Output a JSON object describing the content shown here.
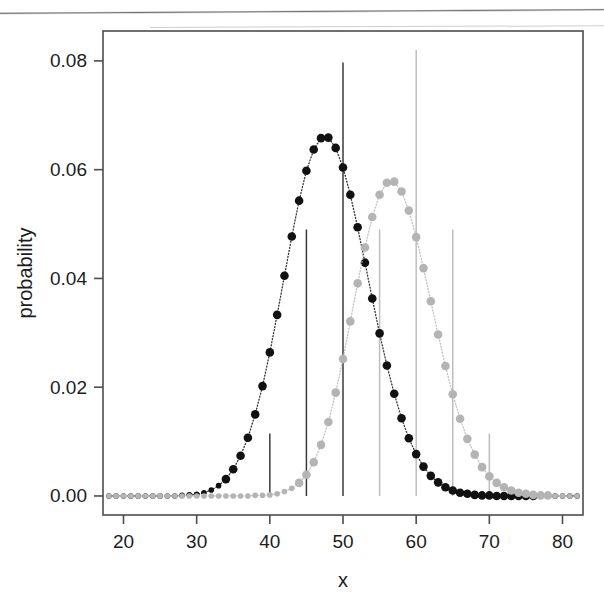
{
  "figure": {
    "kind": "scatter-pmf-plot",
    "background_color": "#ffffff",
    "frame_color": "#4d4d4d",
    "has_top_scan_artifact": true
  },
  "axes": {
    "x_label": "x",
    "y_label": "probability",
    "x_ticks": [
      "20",
      "30",
      "40",
      "50",
      "60",
      "70",
      "80"
    ],
    "y_ticks": [
      "0.00",
      "0.02",
      "0.04",
      "0.06",
      "0.08"
    ]
  },
  "chart_data": {
    "type": "scatter",
    "title": "",
    "xlabel": "x",
    "ylabel": "probability",
    "xlim": [
      17.2,
      82.8
    ],
    "ylim": [
      -0.0035,
      0.0855
    ],
    "x_ticks": [
      20,
      30,
      40,
      50,
      60,
      70,
      80
    ],
    "y_ticks": [
      0.0,
      0.02,
      0.04,
      0.06,
      0.08
    ],
    "grid": false,
    "legend": "none",
    "x": [
      18,
      19,
      20,
      21,
      22,
      23,
      24,
      25,
      26,
      27,
      28,
      29,
      30,
      31,
      32,
      33,
      34,
      35,
      36,
      37,
      38,
      39,
      40,
      41,
      42,
      43,
      44,
      45,
      46,
      47,
      48,
      49,
      50,
      51,
      52,
      53,
      54,
      55,
      56,
      57,
      58,
      59,
      60,
      61,
      62,
      63,
      64,
      65,
      66,
      67,
      68,
      69,
      70,
      71,
      72,
      73,
      74,
      75,
      76,
      77,
      78,
      79,
      80,
      81,
      82
    ],
    "series": [
      {
        "name": "black",
        "color": "#111111",
        "marker": "filled-circle",
        "line_style": "dotted",
        "mean": 50,
        "peak_value": 0.0797,
        "values": [
          0.0,
          0.0,
          0.0,
          0.0,
          0.0,
          0.0,
          0.0,
          0.0,
          0.0,
          0.0,
          0.0001,
          0.0002,
          0.0003,
          0.0006,
          0.0011,
          0.0019,
          0.0031,
          0.0049,
          0.0074,
          0.0107,
          0.015,
          0.0202,
          0.0264,
          0.0333,
          0.0405,
          0.0477,
          0.0543,
          0.0598,
          0.0637,
          0.0658,
          0.0659,
          0.064,
          0.0604,
          0.0554,
          0.0494,
          0.0429,
          0.0363,
          0.0299,
          0.024,
          0.0188,
          0.0143,
          0.0106,
          0.0077,
          0.0054,
          0.0037,
          0.0025,
          0.0016,
          0.001,
          0.0006,
          0.0004,
          0.0002,
          0.0001,
          0.0001,
          0.0,
          0.0,
          0.0,
          0.0,
          0.0,
          0.0,
          0.0,
          0.0,
          0.0,
          0.0,
          0.0,
          0.0
        ]
      },
      {
        "name": "gray",
        "color": "#b4b4b4",
        "marker": "filled-circle",
        "line_style": "dotted",
        "mean": 60,
        "peak_value": 0.082,
        "values": [
          0.0,
          0.0,
          0.0,
          0.0,
          0.0,
          0.0,
          0.0,
          0.0,
          0.0,
          0.0,
          0.0,
          0.0,
          0.0,
          0.0,
          0.0,
          0.0,
          0.0,
          0.0,
          0.0,
          0.0,
          0.0001,
          0.0001,
          0.0002,
          0.0004,
          0.0008,
          0.0014,
          0.0024,
          0.0039,
          0.0062,
          0.0094,
          0.0136,
          0.019,
          0.0252,
          0.0321,
          0.0391,
          0.0457,
          0.0513,
          0.0554,
          0.0576,
          0.0578,
          0.056,
          0.0525,
          0.0476,
          0.0419,
          0.0358,
          0.0297,
          0.0239,
          0.0187,
          0.0142,
          0.0105,
          0.0076,
          0.0053,
          0.0036,
          0.0024,
          0.0016,
          0.001,
          0.0006,
          0.0004,
          0.0002,
          0.0001,
          0.0001,
          0.0,
          0.0,
          0.0,
          0.0
        ]
      }
    ],
    "drop_lines": [
      {
        "x": 40,
        "y": 0.0115,
        "color": "#3a3a3a",
        "series": "black"
      },
      {
        "x": 45,
        "y": 0.049,
        "color": "#3a3a3a",
        "series": "black"
      },
      {
        "x": 50,
        "y": 0.0797,
        "color": "#3a3a3a",
        "series": "black"
      },
      {
        "x": 55,
        "y": 0.049,
        "color": "#bdbdbd",
        "series": "gray"
      },
      {
        "x": 60,
        "y": 0.082,
        "color": "#bdbdbd",
        "series": "gray"
      },
      {
        "x": 65,
        "y": 0.049,
        "color": "#bdbdbd",
        "series": "gray"
      },
      {
        "x": 70,
        "y": 0.0115,
        "color": "#bdbdbd",
        "series": "gray"
      }
    ],
    "marker_overrides": {
      "black_big_markers_from": 34,
      "black_big_markers_to": 76,
      "gray_big_markers_from": 44,
      "gray_big_markers_to": 78
    }
  }
}
